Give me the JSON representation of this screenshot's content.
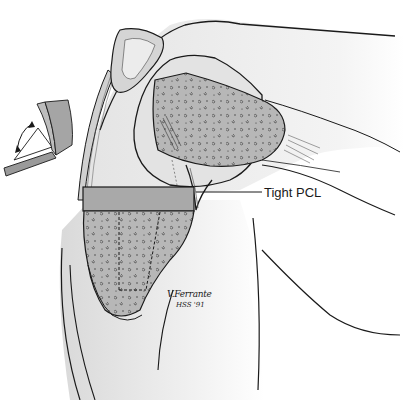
{
  "illustration": {
    "subject": "Flexed knee joint, lateral view, with proximal tibial resection block",
    "labels": {
      "pcl": "Tight PCL"
    },
    "signature": {
      "name": "V.Ferrante",
      "affiliation_year": "HSS '91"
    },
    "inset": {
      "description": "open book icon with double-headed curved arrow (flexion gap analogy)"
    },
    "colors": {
      "outline": "#1a1a1a",
      "bone_fill": "#b9b9b9",
      "soft_tissue": "#e6e6e6",
      "cut_block": "#a8a8a8",
      "background": "#ffffff"
    }
  }
}
